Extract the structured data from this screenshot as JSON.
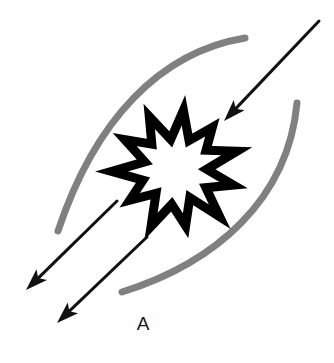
{
  "figure": {
    "title": "",
    "background_color": "#ffffff",
    "labels": [
      {
        "name": "region-label-a",
        "text": "A",
        "x": 143,
        "y": 330
      }
    ],
    "burst": {
      "name": "explosion-starburst",
      "fill_color": "#ffffff",
      "stroke_color": "#000000",
      "stroke_width": 9,
      "center_x": 176,
      "center_y": 170,
      "outer_radius": 62,
      "inner_radius": 33,
      "points": 11,
      "semantic": "explosion-burst-icon"
    },
    "arcs": [
      {
        "name": "gray-arc-upper-left",
        "color": "#808080",
        "stroke_width": 7,
        "path": "M 245 38 C 160 52 95 120 58 231",
        "description": "upper-left lens boundary arc"
      },
      {
        "name": "gray-arc-lower-right",
        "color": "#808080",
        "stroke_width": 7,
        "path": "M 297 103 C 288 200 215 263 122 292",
        "description": "lower-right lens boundary arc"
      }
    ],
    "arrows": [
      {
        "name": "inflow-arrow-top-right",
        "color": "#111111",
        "stroke_width": 3,
        "tail_x": 319,
        "tail_y": 21,
        "tip_x": 224,
        "tip_y": 121,
        "direction": "down-left",
        "meaning": "inbound toward burst"
      },
      {
        "name": "outflow-arrow-upper-left",
        "color": "#111111",
        "stroke_width": 3,
        "tail_x": 117,
        "tail_y": 201,
        "tip_x": 26,
        "tip_y": 290,
        "direction": "down-left",
        "meaning": "outbound away from burst"
      },
      {
        "name": "outflow-arrow-lower-left",
        "color": "#111111",
        "stroke_width": 3,
        "tail_x": 147,
        "tail_y": 237,
        "tip_x": 57,
        "tip_y": 323,
        "direction": "down-left",
        "meaning": "outbound away from burst"
      }
    ]
  }
}
